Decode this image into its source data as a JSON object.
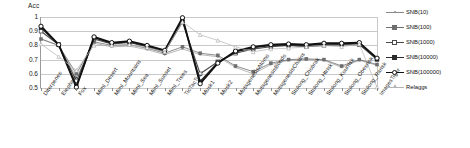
{
  "chart_data": {
    "type": "line",
    "title": "",
    "ylabel": "Acc",
    "xlabel": "",
    "ylim": [
      0.5,
      1.0
    ],
    "yticks": [
      "1",
      "0.9",
      "0.8",
      "0.7",
      "0.6",
      "0.5"
    ],
    "ytick_values": [
      1.0,
      0.9,
      0.8,
      0.7,
      0.6,
      0.5
    ],
    "grid": true,
    "legend_position": "right",
    "categories": [
      "Diterpenes",
      "Elephant",
      "Fox",
      "Miml_Desert",
      "Miml_Mountains",
      "Miml_Sea",
      "Miml_Sunset",
      "Miml_Trees",
      "TicTacToe",
      "Musk1",
      "Musk2",
      "MutagenesisAtoms",
      "MutagenesisBonds",
      "MutagenesisChains",
      "Stulong_Chobrak",
      "Stulong_Htrisk",
      "Stulong_Kourrisk",
      "Stulong_Obesrisk",
      "Stulong_Rarisk",
      "ImagesTiger"
    ],
    "series": [
      {
        "name": "SNB(10)",
        "color": "#8a8a8a",
        "width": 0.6,
        "marker": "dot",
        "values": [
          0.845,
          0.8,
          0.575,
          0.815,
          0.79,
          0.795,
          0.77,
          0.735,
          0.775,
          0.735,
          0.72,
          0.645,
          0.6,
          0.665,
          0.695,
          0.7,
          0.695,
          0.645,
          0.695,
          0.66
        ]
      },
      {
        "name": "SNB(100)",
        "color": "#6e6e6e",
        "width": 0.8,
        "marker": "square-filled",
        "values": [
          0.845,
          0.8,
          0.6,
          0.825,
          0.8,
          0.805,
          0.78,
          0.745,
          0.79,
          0.745,
          0.73,
          0.655,
          0.615,
          0.675,
          0.7,
          0.705,
          0.7,
          0.655,
          0.7,
          0.665
        ]
      },
      {
        "name": "SNB(1000)",
        "color": "#4a4a4a",
        "width": 1.1,
        "marker": "square-open",
        "values": [
          0.9,
          0.805,
          0.55,
          0.845,
          0.81,
          0.82,
          0.79,
          0.755,
          0.965,
          0.6,
          0.685,
          0.745,
          0.775,
          0.79,
          0.8,
          0.79,
          0.8,
          0.805,
          0.805,
          0.7
        ]
      },
      {
        "name": "SNB(10000)",
        "color": "#2b2b2b",
        "width": 1.5,
        "marker": "square-filled",
        "values": [
          0.925,
          0.805,
          0.515,
          0.855,
          0.815,
          0.825,
          0.795,
          0.76,
          0.985,
          0.545,
          0.68,
          0.755,
          0.785,
          0.8,
          0.805,
          0.8,
          0.81,
          0.81,
          0.815,
          0.705
        ]
      },
      {
        "name": "SNB(100000)",
        "color": "#111111",
        "width": 1.8,
        "marker": "circle-open",
        "values": [
          0.935,
          0.805,
          0.505,
          0.86,
          0.82,
          0.83,
          0.8,
          0.765,
          0.995,
          0.53,
          0.675,
          0.76,
          0.79,
          0.805,
          0.81,
          0.805,
          0.815,
          0.815,
          0.82,
          0.71
        ]
      },
      {
        "name": "Relaggs",
        "color": "#b4b4b4",
        "width": 0.7,
        "marker": "triangle-open",
        "values": [
          0.81,
          0.72,
          0.625,
          0.8,
          0.8,
          0.805,
          0.785,
          0.755,
          0.965,
          0.875,
          0.835,
          0.79,
          0.755,
          0.775,
          0.78,
          0.79,
          0.8,
          0.79,
          0.81,
          0.505
        ]
      }
    ]
  },
  "legend": {
    "items": [
      {
        "label": "SNB(10)"
      },
      {
        "label": "SNB(100)"
      },
      {
        "label": "SNB(1000)"
      },
      {
        "label": "SNB(10000)"
      },
      {
        "label": "SNB(100000)"
      },
      {
        "label": "Relaggs"
      }
    ]
  }
}
